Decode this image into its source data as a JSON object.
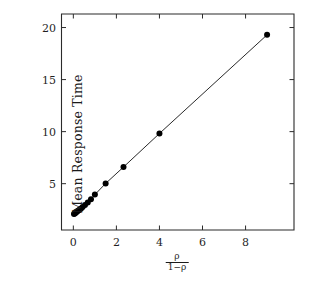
{
  "chart_data": {
    "type": "scatter",
    "title": "",
    "subtitle": "",
    "xlabel_numerator": "ρ",
    "xlabel_denominator": "1−ρ",
    "ylabel": "Mean Response Time",
    "xlim": [
      -0.55,
      10.25
    ],
    "ylim": [
      0.55,
      21.3
    ],
    "xticks": [
      0,
      2,
      4,
      6,
      8
    ],
    "xtick_labels": [
      "0",
      "2",
      "4",
      "6",
      "8"
    ],
    "yticks": [
      5,
      10,
      15,
      20
    ],
    "ytick_labels": [
      "5",
      "10",
      "15",
      "20"
    ],
    "grid": false,
    "legend": false,
    "legend_position": "none",
    "marker_color": "#000000",
    "line_color": "#111111",
    "axis_color": "#2b2b2b",
    "background_color": "#ffffff",
    "series": [
      {
        "name": "Mean response time",
        "x": [
          0.03,
          0.06,
          0.09,
          0.12,
          0.16,
          0.2,
          0.25,
          0.3,
          0.36,
          0.43,
          0.54,
          0.67,
          0.82,
          1.0,
          1.5,
          2.33,
          4.0,
          9.0
        ],
        "y": [
          2.08,
          2.13,
          2.18,
          2.24,
          2.3,
          2.37,
          2.44,
          2.52,
          2.62,
          2.75,
          2.95,
          3.2,
          3.5,
          3.95,
          5.02,
          6.6,
          9.82,
          19.3
        ]
      }
    ]
  },
  "axes": {
    "x_tick_text": [
      "0",
      "2",
      "4",
      "6",
      "8"
    ],
    "y_tick_text": [
      "5",
      "10",
      "15",
      "20"
    ]
  }
}
